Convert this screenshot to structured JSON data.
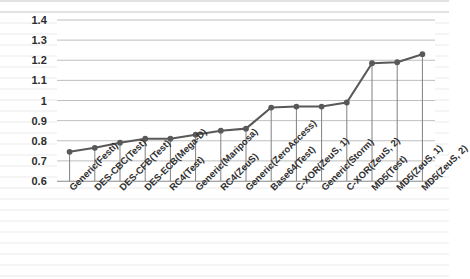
{
  "chart_data": {
    "type": "line",
    "title": "",
    "subtitle": "",
    "xlabel": "",
    "ylabel": "",
    "ylim": [
      0.6,
      1.4
    ],
    "ytick_step": 0.1,
    "yticks": [
      "1.4",
      "1.3",
      "1.2",
      "1.1",
      "1",
      "0.9",
      "0.8",
      "0.7",
      "0.6"
    ],
    "grid": true,
    "legend": false,
    "legend_position": "none",
    "marker": "circle",
    "droplines": true,
    "categories": [
      "Generic(Festi)",
      "DES-CBC(Test)",
      "DES-CFB(Test)",
      "DES-ECB(Mega-D)",
      "RC4(Test)",
      "Generic(Mariposa)",
      "RC4(ZeuS)",
      "Generic(ZeroAccess)",
      "Base64(Test)",
      "C-XOR(ZeuS, 1)",
      "Generic(Storm)",
      "C-XOR(ZeuS, 2)",
      "MD5(Test)",
      "MD5(ZeuS, 1)",
      "MD5(ZeuS, 2)"
    ],
    "values": [
      0.745,
      0.765,
      0.79,
      0.81,
      0.81,
      0.83,
      0.85,
      0.86,
      0.965,
      0.97,
      0.97,
      0.99,
      1.185,
      1.19,
      1.23
    ],
    "series": [
      {
        "name": "",
        "values": [
          0.745,
          0.765,
          0.79,
          0.81,
          0.81,
          0.83,
          0.85,
          0.86,
          0.965,
          0.97,
          0.97,
          0.99,
          1.185,
          1.19,
          1.23
        ]
      }
    ]
  },
  "colors": {
    "line": "#595959",
    "marker": "#595959",
    "gridline": "#bfbfbf",
    "dropline": "#808080",
    "axis": "#a6a6a6",
    "text": "#2d2d2d",
    "background": "#ffffff"
  }
}
